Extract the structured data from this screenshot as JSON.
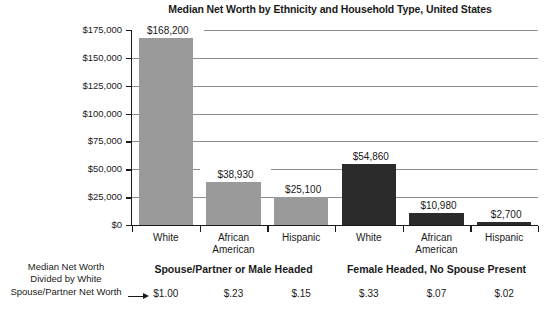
{
  "chart_data": {
    "type": "bar",
    "title": "Median Net Worth by Ethnicity and Household Type, United States",
    "xlabel": "",
    "ylabel": "Median Net Worth in Dollars",
    "ylim": [
      0,
      175000
    ],
    "grid": true,
    "legend": "none",
    "categories": [
      "White",
      "African American",
      "Hispanic",
      "White",
      "African American",
      "Hispanic"
    ],
    "category_lines": [
      [
        "White"
      ],
      [
        "African",
        "American"
      ],
      [
        "Hispanic"
      ],
      [
        "White"
      ],
      [
        "African",
        "American"
      ],
      [
        "Hispanic"
      ]
    ],
    "values": [
      168200,
      38930,
      25100,
      54860,
      10980,
      2700
    ],
    "value_labels": [
      "$168,200",
      "$38,930",
      "$25,100",
      "$54,860",
      "$10,980",
      "$2,700"
    ],
    "bar_colors": [
      "#9a9a9a",
      "#9a9a9a",
      "#9a9a9a",
      "#2b2b2b",
      "#2b2b2b",
      "#2b2b2b"
    ],
    "ytick_values": [
      0,
      25000,
      50000,
      75000,
      100000,
      125000,
      150000,
      175000
    ],
    "ytick_labels": [
      "$0",
      "$25,000",
      "$50,000",
      "$75,000",
      "$100,000",
      "$125,000",
      "$150,000",
      "$175,000"
    ],
    "groups": [
      {
        "label": "Spouse/Partner or Male Headed",
        "categories": [
          0,
          1,
          2
        ]
      },
      {
        "label": "Female Headed, No Spouse Present",
        "categories": [
          3,
          4,
          5
        ]
      }
    ],
    "annotation": {
      "explainer_lines": [
        "Median Net Worth",
        "Divided by White",
        "Spouse/Partner Net Worth"
      ],
      "arrow": "right-arrow",
      "ratio_labels": [
        "$1.00",
        "$.23",
        "$.15",
        "$.33",
        "$.07",
        "$.02"
      ],
      "ratio_values": [
        1.0,
        0.23,
        0.15,
        0.33,
        0.07,
        0.02
      ]
    },
    "colors": {
      "light_bar": "#9a9a9a",
      "dark_bar": "#2b2b2b",
      "gridline": "#8d8d8d",
      "axis": "#1a1a1a",
      "background": "#ffffff"
    }
  },
  "ytick_labels": {
    "0": "$175,000",
    "1": "$150,000",
    "2": "$125,000",
    "3": "$100,000",
    "4": "$75,000",
    "5": "$50,000",
    "6": "$25,000",
    "7": "$0"
  }
}
